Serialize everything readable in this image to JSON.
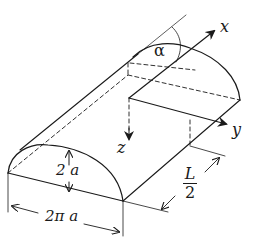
{
  "diagram": {
    "type": "half-cylinder geometry with coordinate axes",
    "labels": {
      "x_axis": "x",
      "y_axis": "y",
      "z_axis": "z",
      "angle": "α",
      "height": "2 a",
      "width": "2π a",
      "length_num": "L",
      "length_den": "2"
    },
    "colors": {
      "stroke": "#1a1a1a",
      "background": "#ffffff"
    }
  }
}
